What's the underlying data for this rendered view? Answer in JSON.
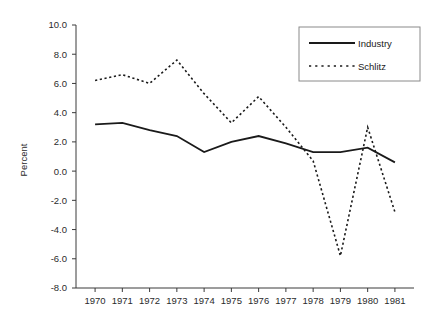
{
  "chart_data": {
    "type": "line",
    "title": "",
    "xlabel": "",
    "ylabel": "Percent",
    "x": [
      1970,
      1971,
      1972,
      1973,
      1974,
      1975,
      1976,
      1977,
      1978,
      1979,
      1980,
      1981
    ],
    "categories": [
      "1970",
      "1971",
      "1972",
      "1973",
      "1974",
      "1975",
      "1976",
      "1977",
      "1978",
      "1979",
      "1980",
      "1981"
    ],
    "series": [
      {
        "name": "Industry",
        "style": "solid",
        "color": "#1a1a1a",
        "values": [
          3.2,
          3.3,
          2.8,
          2.4,
          1.3,
          2.0,
          2.4,
          1.9,
          1.3,
          1.3,
          1.6,
          0.6
        ]
      },
      {
        "name": "Schlitz",
        "style": "dotted",
        "color": "#1a1a1a",
        "values": [
          6.2,
          6.6,
          6.0,
          7.6,
          5.3,
          3.3,
          5.1,
          3.0,
          0.7,
          -5.8,
          3.0,
          -2.8
        ]
      }
    ],
    "ylim": [
      -8.0,
      10.0
    ],
    "ytick_values": [
      10.0,
      8.0,
      6.0,
      4.0,
      2.0,
      0.0,
      -2.0,
      -4.0,
      -6.0,
      -8.0
    ],
    "ytick_labels": [
      "10.0",
      "8.0",
      "6.0",
      "4.0",
      "2.0",
      "0.0",
      "-2.0",
      "-4.0",
      "-6.0",
      "-8.0"
    ],
    "xlim": [
      1969.3,
      1981.7
    ],
    "grid": false,
    "legend_position": "top-right",
    "legend_entries": [
      "Industry",
      "Schlitz"
    ]
  }
}
